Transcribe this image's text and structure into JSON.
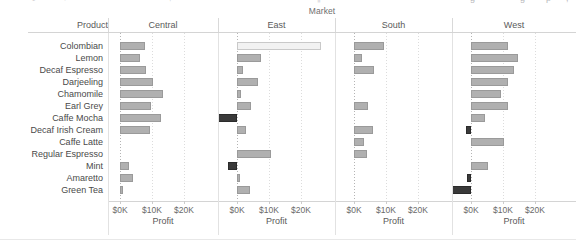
{
  "toolbar": {
    "items": [
      {
        "label": "↺",
        "x": 30
      },
      {
        "label": "←",
        "x": 62
      },
      {
        "label": "↑",
        "x": 168
      },
      {
        "label": "¶",
        "x": 316
      },
      {
        "label": "ɡ",
        "x": 470
      },
      {
        "label": "ɡ",
        "x": 520
      },
      {
        "label": "ρ",
        "x": 546
      },
      {
        "label": ",",
        "x": 566
      }
    ]
  },
  "header": {
    "column_group_title": "Market",
    "product_column_label": "Product",
    "markets": [
      "Central",
      "East",
      "South",
      "West"
    ]
  },
  "axis": {
    "title": "Profit",
    "tick_labels": [
      "$0K",
      "$10K",
      "$20K"
    ],
    "tick_values": [
      0,
      10000,
      20000
    ],
    "range_min": -6000,
    "range_max": 28000
  },
  "colors": {
    "positive_bar": "#b0b0b0",
    "positive_bar_border": "#9a9a9a",
    "negative_bar": "#3a3a3a",
    "negative_bar_border": "#2b2b2b",
    "highlight_bar": "#f2f2f2",
    "highlight_bar_border": "#c9c9c9",
    "grid": "#dcdcdc",
    "text": "#4a4a4a"
  },
  "chart_data": {
    "type": "bar",
    "title": "Market",
    "xlabel": "Profit",
    "ylabel": "Product",
    "orientation": "horizontal",
    "grid": true,
    "legend_position": "none",
    "xlim": [
      -6000,
      28000
    ],
    "xticks": [
      0,
      10000,
      20000
    ],
    "xticklabels": [
      "$0K",
      "$10K",
      "$20K"
    ],
    "categories": [
      "Colombian",
      "Lemon",
      "Decaf Espresso",
      "Darjeeling",
      "Chamomile",
      "Earl Grey",
      "Caffe Mocha",
      "Decaf Irish Cream",
      "Caffe Latte",
      "Regular Espresso",
      "Mint",
      "Amaretto",
      "Green Tea"
    ],
    "panels": [
      "Central",
      "East",
      "South",
      "West"
    ],
    "series": [
      {
        "name": "Central",
        "values": [
          7900,
          6100,
          8000,
          10200,
          13300,
          9600,
          12800,
          9500,
          0,
          0,
          2800,
          4200,
          800
        ]
      },
      {
        "name": "East",
        "values": [
          26400,
          7600,
          2000,
          6700,
          1200,
          4300,
          -6000,
          2700,
          0,
          10600,
          -2800,
          800,
          4200
        ]
      },
      {
        "name": "South",
        "values": [
          9500,
          2400,
          6300,
          0,
          0,
          4400,
          0,
          6000,
          3000,
          4000,
          0,
          0,
          0
        ]
      },
      {
        "name": "West",
        "values": [
          11600,
          14700,
          13400,
          11500,
          9500,
          11700,
          4400,
          -1500,
          10200,
          0,
          5300,
          -1200,
          -6000
        ]
      }
    ]
  }
}
